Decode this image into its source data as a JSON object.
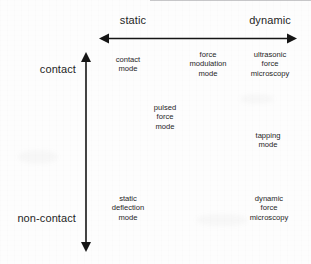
{
  "diagram": {
    "axes": {
      "horizontal": {
        "name": "excitation-axis",
        "left_label": "static",
        "right_label": "dynamic"
      },
      "vertical": {
        "name": "tip-sample-interaction-axis",
        "top_label": "contact",
        "bottom_label": "non-contact"
      }
    },
    "colors": {
      "background": "#fdfdfd",
      "ink": "#1f1f1f",
      "arrow": "#151515"
    },
    "entries": [
      {
        "id": "contact-mode",
        "lines": [
          "contact",
          "mode"
        ]
      },
      {
        "id": "force-modulation-mode",
        "lines": [
          "force",
          "modulation",
          "mode"
        ]
      },
      {
        "id": "ultrasonic-force-microscopy",
        "lines": [
          "ultrasonic",
          "force",
          "microscopy"
        ]
      },
      {
        "id": "pulsed-force-mode",
        "lines": [
          "pulsed",
          "force",
          "mode"
        ]
      },
      {
        "id": "tapping-mode",
        "lines": [
          "tapping",
          "mode"
        ]
      },
      {
        "id": "static-deflection-mode",
        "lines": [
          "static",
          "deflection",
          "mode"
        ]
      },
      {
        "id": "dynamic-force-microscopy",
        "lines": [
          "dynamic",
          "force",
          "microscopy"
        ]
      }
    ]
  }
}
